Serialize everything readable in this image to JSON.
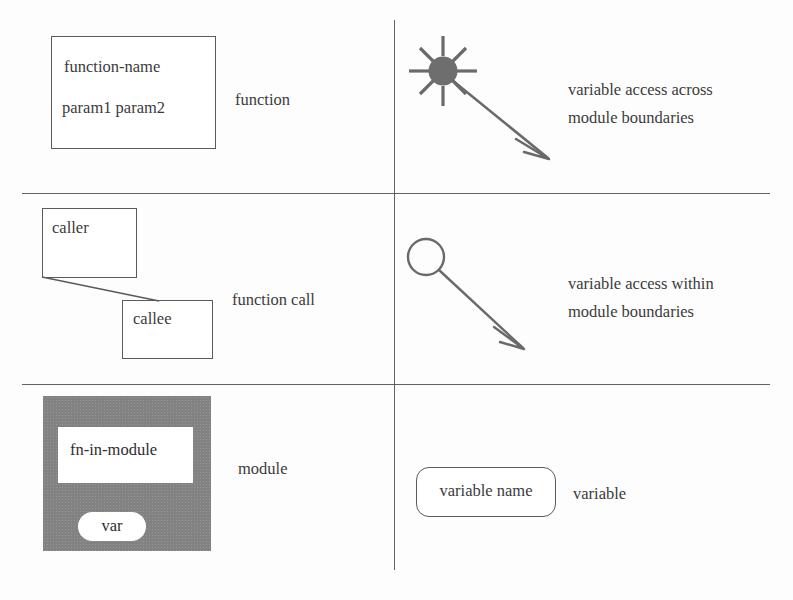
{
  "diagram": {
    "columns": 2,
    "rows": 3,
    "line_color": "#4c4c4c",
    "module_fill": "#828282",
    "text_color": "#3b3b3b"
  },
  "cells": {
    "function": {
      "label": "function",
      "box": {
        "name": "function-name",
        "params": "param1 param2"
      }
    },
    "function_call": {
      "label": "function call",
      "caller": "caller",
      "callee": "callee"
    },
    "module": {
      "label": "module",
      "inner_function": "fn-in-module",
      "inner_variable": "var"
    },
    "variable_access_across": {
      "label_line1": "variable access across",
      "label_line2": "module boundaries",
      "symbol": "filled-starburst-with-arrow"
    },
    "variable_access_within": {
      "label_line1": "variable access within",
      "label_line2": "module boundaries",
      "symbol": "open-circle-with-arrow"
    },
    "variable": {
      "label": "variable",
      "box": "variable name"
    }
  }
}
